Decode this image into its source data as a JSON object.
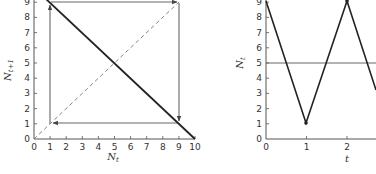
{
  "chart_data": [
    {
      "type": "line",
      "title": "Cobweb plot",
      "xlabel": "N_t",
      "ylabel": "N_t+1",
      "xlim": [
        0,
        10
      ],
      "ylim": [
        0,
        9
      ],
      "x_ticks": [
        "0",
        "1",
        "2",
        "3",
        "4",
        "5",
        "6",
        "7",
        "8",
        "9",
        "10"
      ],
      "y_ticks": [
        "0",
        "1",
        "2",
        "3",
        "4",
        "5",
        "6",
        "7",
        "8",
        "9"
      ],
      "grid": false,
      "series": [
        {
          "name": "map",
          "style": "solid-thick",
          "x": [
            1,
            10
          ],
          "y": [
            9,
            0
          ]
        },
        {
          "name": "identity",
          "style": "dashed",
          "x": [
            0,
            9
          ],
          "y": [
            0,
            9
          ]
        },
        {
          "name": "cobweb",
          "style": "arrows",
          "x": [
            1,
            1,
            9,
            9,
            1
          ],
          "y": [
            1,
            9,
            9,
            1,
            1
          ]
        }
      ]
    },
    {
      "type": "line",
      "title": "Time series",
      "xlabel": "t",
      "ylabel": "N_t",
      "xlim": [
        0,
        2.8
      ],
      "ylim": [
        0,
        9
      ],
      "x_ticks": [
        "0",
        "1",
        "2"
      ],
      "y_ticks": [
        "0",
        "1",
        "2",
        "3",
        "4",
        "5",
        "6",
        "7",
        "8",
        "9"
      ],
      "grid": false,
      "series": [
        {
          "name": "N_t",
          "x": [
            0,
            1,
            2,
            3
          ],
          "y": [
            9,
            1,
            9,
            1
          ]
        },
        {
          "name": "equilibrium",
          "x": [
            0,
            3
          ],
          "y": [
            5,
            5
          ]
        }
      ]
    }
  ],
  "left": {
    "xlabel_main": "N",
    "xlabel_sub": "t",
    "ylabel_main": "N",
    "ylabel_sub": "t+1",
    "x_ticks": [
      "0",
      "1",
      "2",
      "3",
      "4",
      "5",
      "6",
      "7",
      "8",
      "9",
      "10"
    ],
    "y_ticks": [
      "0",
      "1",
      "2",
      "3",
      "4",
      "5",
      "6",
      "7",
      "8",
      "9"
    ]
  },
  "right": {
    "xlabel": "t",
    "ylabel_main": "N",
    "ylabel_sub": "t",
    "x_ticks": [
      "0",
      "1",
      "2"
    ],
    "y_ticks": [
      "0",
      "1",
      "2",
      "3",
      "4",
      "5",
      "6",
      "7",
      "8",
      "9"
    ]
  },
  "colors": {
    "axis": "#555555",
    "line": "#222222",
    "cobweb": "#666666"
  }
}
